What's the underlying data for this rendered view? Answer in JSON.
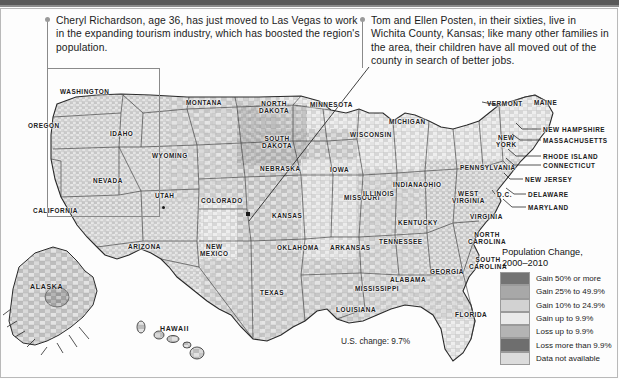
{
  "figure": {
    "title_bar": true,
    "us_change_note": "U.S. change: 9.7%"
  },
  "callouts": [
    {
      "id": "las-vegas",
      "text": "Cheryl Richardson, age 36, has just moved to Las Vegas to work in the expanding tourism industry, which has boosted the region's population.",
      "marker": "Las Vegas, Nevada"
    },
    {
      "id": "wichita-county",
      "text": "Tom and Ellen Posten, in their sixties, live in Wichita County, Kansas; like many other families in the area, their children have all moved out of the county in search of better jobs.",
      "marker": "Wichita County, Kansas"
    }
  ],
  "legend": {
    "title_line1": "Population Change,",
    "title_line2": "2000–2010",
    "items": [
      {
        "label": "Gain 50% or more",
        "color": "#737373"
      },
      {
        "label": "Gain 25% to 49.9%",
        "color": "#a8a8a8"
      },
      {
        "label": "Gain 10% to 24.9%",
        "color": "#d2d2d2"
      },
      {
        "label": "Gain up to 9.9%",
        "color": "#eaeaea"
      },
      {
        "label": "Loss up to 9.9%",
        "color": "#b4b4b4"
      },
      {
        "label": "Loss more than 9.9%",
        "color": "#6e6e6e"
      },
      {
        "label": "Data not available",
        "color": "#dcdcdc"
      }
    ]
  },
  "map": {
    "state_labels": [
      {
        "name": "WASHINGTON",
        "x": 60,
        "y": 88,
        "lines": [
          "WASHINGTON"
        ]
      },
      {
        "name": "OREGON",
        "x": 28,
        "y": 122,
        "lines": [
          "OREGON"
        ]
      },
      {
        "name": "IDAHO",
        "x": 110,
        "y": 130,
        "lines": [
          "IDAHO"
        ]
      },
      {
        "name": "MONTANA",
        "x": 186,
        "y": 99,
        "lines": [
          "MONTANA"
        ]
      },
      {
        "name": "WYOMING",
        "x": 152,
        "y": 152,
        "lines": [
          "WYOMING"
        ]
      },
      {
        "name": "NEVADA",
        "x": 93,
        "y": 177,
        "lines": [
          "NEVADA"
        ]
      },
      {
        "name": "UTAH",
        "x": 155,
        "y": 192,
        "lines": [
          "UTAH"
        ]
      },
      {
        "name": "CALIFORNIA",
        "x": 33,
        "y": 207,
        "lines": [
          "CALIFORNIA"
        ]
      },
      {
        "name": "ARIZONA",
        "x": 128,
        "y": 243,
        "lines": [
          "ARIZONA"
        ]
      },
      {
        "name": "NEW MEXICO",
        "x": 200,
        "y": 243,
        "lines": [
          "NEW",
          "MEXICO"
        ]
      },
      {
        "name": "COLORADO",
        "x": 201,
        "y": 197,
        "lines": [
          "COLORADO"
        ]
      },
      {
        "name": "NORTH DAKOTA",
        "x": 259,
        "y": 100,
        "lines": [
          "NORTH",
          "DAKOTA"
        ]
      },
      {
        "name": "SOUTH DAKOTA",
        "x": 262,
        "y": 135,
        "lines": [
          "SOUTH",
          "DAKOTA"
        ]
      },
      {
        "name": "NEBRASKA",
        "x": 260,
        "y": 165,
        "lines": [
          "NEBRASKA"
        ]
      },
      {
        "name": "KANSAS",
        "x": 272,
        "y": 212,
        "lines": [
          "KANSAS"
        ]
      },
      {
        "name": "MINNESOTA",
        "x": 310,
        "y": 101,
        "lines": [
          "MINNESOTA"
        ]
      },
      {
        "name": "IOWA",
        "x": 330,
        "y": 166,
        "lines": [
          "IOWA"
        ]
      },
      {
        "name": "MISSOURI",
        "x": 344,
        "y": 194,
        "lines": [
          "MISSOURI"
        ]
      },
      {
        "name": "WISCONSIN",
        "x": 350,
        "y": 131,
        "lines": [
          "WISCONSIN"
        ]
      },
      {
        "name": "MICHIGAN",
        "x": 389,
        "y": 118,
        "lines": [
          "MICHIGAN"
        ]
      },
      {
        "name": "ILLINOIS",
        "x": 363,
        "y": 190,
        "lines": [
          "ILLINOIS"
        ]
      },
      {
        "name": "INDIANA",
        "x": 393,
        "y": 181,
        "lines": [
          "INDIANA"
        ]
      },
      {
        "name": "OHIO",
        "x": 423,
        "y": 181,
        "lines": [
          "OHIO"
        ]
      },
      {
        "name": "OKLAHOMA",
        "x": 277,
        "y": 244,
        "lines": [
          "OKLAHOMA"
        ]
      },
      {
        "name": "ARKANSAS",
        "x": 330,
        "y": 244,
        "lines": [
          "ARKANSAS"
        ]
      },
      {
        "name": "TEXAS",
        "x": 260,
        "y": 289,
        "lines": [
          "TEXAS"
        ]
      },
      {
        "name": "LOUISIANA",
        "x": 336,
        "y": 306,
        "lines": [
          "LOUISIANA"
        ]
      },
      {
        "name": "MISSISSIPPI",
        "x": 355,
        "y": 285,
        "lines": [
          "MISSISSIPPI"
        ]
      },
      {
        "name": "ALABAMA",
        "x": 390,
        "y": 276,
        "lines": [
          "ALABAMA"
        ]
      },
      {
        "name": "TENNESSEE",
        "x": 379,
        "y": 238,
        "lines": [
          "TENNESSEE"
        ]
      },
      {
        "name": "KENTUCKY",
        "x": 398,
        "y": 219,
        "lines": [
          "KENTUCKY"
        ]
      },
      {
        "name": "WEST VIRGINIA",
        "x": 452,
        "y": 190,
        "lines": [
          "WEST",
          "VIRGINIA"
        ]
      },
      {
        "name": "VIRGINIA",
        "x": 470,
        "y": 213,
        "lines": [
          "VIRGINIA"
        ]
      },
      {
        "name": "NORTH CAROLINA",
        "x": 468,
        "y": 231,
        "lines": [
          "NORTH",
          "CAROLINA"
        ]
      },
      {
        "name": "SOUTH CAROLINA",
        "x": 469,
        "y": 256,
        "lines": [
          "SOUTH",
          "CAROLINA"
        ]
      },
      {
        "name": "GEORGIA",
        "x": 430,
        "y": 268,
        "lines": [
          "GEORGIA"
        ]
      },
      {
        "name": "FLORIDA",
        "x": 455,
        "y": 311,
        "lines": [
          "FLORIDA"
        ]
      },
      {
        "name": "PENNSYLVANIA",
        "x": 460,
        "y": 164,
        "lines": [
          "PENNSYLVANIA"
        ]
      },
      {
        "name": "NEW YORK",
        "x": 496,
        "y": 134,
        "lines": [
          "NEW",
          "YORK"
        ]
      },
      {
        "name": "VERMONT",
        "x": 487,
        "y": 100,
        "lines": [
          "VERMONT"
        ]
      },
      {
        "name": "MAINE",
        "x": 534,
        "y": 99,
        "lines": [
          "MAINE"
        ]
      },
      {
        "name": "NEW HAMPSHIRE",
        "x": 543,
        "y": 126,
        "lines": [
          "NEW HAMPSHIRE"
        ]
      },
      {
        "name": "MASSACHUSETTS",
        "x": 543,
        "y": 137,
        "lines": [
          "MASSACHUSETTS"
        ]
      },
      {
        "name": "RHODE ISLAND",
        "x": 543,
        "y": 153,
        "lines": [
          "RHODE ISLAND"
        ]
      },
      {
        "name": "CONNECTICUT",
        "x": 543,
        "y": 162,
        "lines": [
          "CONNECTICUT"
        ]
      },
      {
        "name": "NEW JERSEY",
        "x": 525,
        "y": 176,
        "lines": [
          "NEW JERSEY"
        ]
      },
      {
        "name": "DELAWARE",
        "x": 528,
        "y": 191,
        "lines": [
          "DELAWARE"
        ]
      },
      {
        "name": "MARYLAND",
        "x": 528,
        "y": 204,
        "lines": [
          "MARYLAND"
        ]
      },
      {
        "name": "D.C.",
        "x": 497,
        "y": 191,
        "lines": [
          "D.C."
        ]
      }
    ],
    "inset_labels": [
      {
        "name": "ALASKA",
        "x": 30,
        "y": 283
      },
      {
        "name": "HAWAII",
        "x": 160,
        "y": 325
      }
    ]
  }
}
